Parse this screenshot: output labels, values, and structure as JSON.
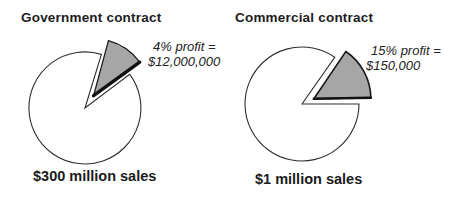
{
  "figure_title": "Contract profit comparison pie charts",
  "colors": {
    "background": "#ffffff",
    "slice_fill": "#a6a6a6",
    "circle_stroke": "#2e2e2e",
    "slice_stroke": "#1a1a1a",
    "text": "#1a1a1a"
  },
  "charts": [
    {
      "title": "Government contract",
      "annotation_line1": "4% profit =",
      "annotation_line2": "$12,000,000",
      "sales_label": "$300 million sales"
    },
    {
      "title": "Commercial contract",
      "annotation_line1": "15% profit =",
      "annotation_line2": "$150,000",
      "sales_label": "$1 million sales"
    }
  ],
  "chart_data": [
    {
      "type": "pie",
      "title": "Government contract",
      "slices": [
        {
          "label": "profit",
          "pct": 4,
          "value_label": "$12,000,000",
          "color": "#a6a6a6",
          "exploded": true
        },
        {
          "label": "remaining sales",
          "pct": 96,
          "color": "#ffffff"
        }
      ],
      "total_label": "$300 million sales",
      "annotation": "4% profit = $12,000,000",
      "legend": "none",
      "draw": {
        "notch_start_deg": 37,
        "notch_end_deg": 73,
        "slice_start_deg": 36,
        "slice_end_deg": 75,
        "explode_px": 15,
        "explode_angle_deg": 55,
        "slice_radius": 57,
        "shadow_width": 3.4,
        "slice_stroke_width": 1.3
      }
    },
    {
      "type": "pie",
      "title": "Commercial contract",
      "slices": [
        {
          "label": "profit",
          "pct": 15,
          "value_label": "$150,000",
          "color": "#a6a6a6",
          "exploded": true
        },
        {
          "label": "remaining sales",
          "pct": 85,
          "color": "#ffffff"
        }
      ],
      "total_label": "$1 million sales",
      "annotation": "15% profit = $150,000",
      "legend": "none",
      "draw": {
        "notch_start_deg": 0,
        "notch_end_deg": 55,
        "slice_start_deg": 1,
        "slice_end_deg": 56,
        "explode_px": 13,
        "explode_angle_deg": 24,
        "slice_radius": 57,
        "shadow_width": 2.4,
        "slice_stroke_width": 1.6
      }
    }
  ]
}
